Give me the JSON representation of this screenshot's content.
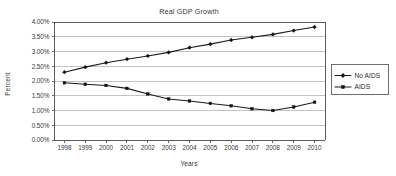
{
  "chart_data": {
    "type": "line",
    "title": "Real GDP Growth",
    "xlabel": "Years",
    "ylabel": "Percent",
    "categories": [
      "1998",
      "1999",
      "2000",
      "2001",
      "2002",
      "2003",
      "2004",
      "2005",
      "2006",
      "2007",
      "2008",
      "2009",
      "2010"
    ],
    "series": [
      {
        "name": "No AIDS",
        "marker": "diamond",
        "values": [
          2.3,
          2.47,
          2.62,
          2.74,
          2.85,
          2.97,
          3.13,
          3.25,
          3.39,
          3.48,
          3.58,
          3.71,
          3.83
        ]
      },
      {
        "name": "AIDS",
        "marker": "square",
        "values": [
          1.94,
          1.89,
          1.85,
          1.75,
          1.56,
          1.39,
          1.32,
          1.24,
          1.16,
          1.06,
          1.0,
          1.12,
          1.28
        ]
      }
    ],
    "ylim": [
      0,
      4
    ],
    "ytick_values": [
      0,
      0.5,
      1.0,
      1.5,
      2.0,
      2.5,
      3.0,
      3.5,
      4.0
    ],
    "ytick_labels": [
      "0.00%",
      "0.50%",
      "1.00%",
      "1.50%",
      "2.00%",
      "2.50%",
      "3.00%",
      "3.50%",
      "4.00%"
    ],
    "grid": "horizontal",
    "legend_position": "right",
    "line_color": "#111111"
  },
  "legend": {
    "entries": [
      {
        "label": "No AIDS"
      },
      {
        "label": "AIDS"
      }
    ]
  }
}
